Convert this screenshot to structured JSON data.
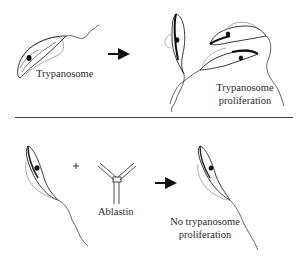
{
  "diagram": {
    "top_panel": {
      "input_label": "Trypanosome",
      "output_label_line1": "Trypanosome",
      "output_label_line2": "proliferation"
    },
    "bottom_panel": {
      "operator": "+",
      "antibody_label": "Ablastin",
      "output_label_line1": "No trypanosome",
      "output_label_line2": "proliferation"
    },
    "colors": {
      "line": "#222222",
      "background": "#ffffff",
      "divider": "#444444"
    }
  }
}
